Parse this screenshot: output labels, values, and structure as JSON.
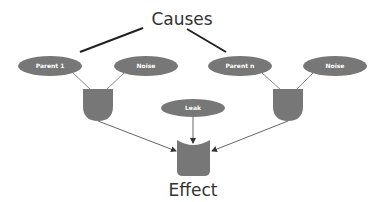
{
  "diagram": {
    "title": "Causes",
    "effect_label": "Effect",
    "nodes": {
      "parent1": {
        "label": "Parent 1"
      },
      "noise1": {
        "label": "Noise"
      },
      "parentn": {
        "label": "Parent n"
      },
      "noise2": {
        "label": "Noise"
      },
      "leak": {
        "label": "Leak"
      }
    },
    "colors": {
      "node_fill": "#777777",
      "line": "#777777",
      "cause_line": "#222222",
      "text": "#333333",
      "background": "#ffffff"
    }
  }
}
